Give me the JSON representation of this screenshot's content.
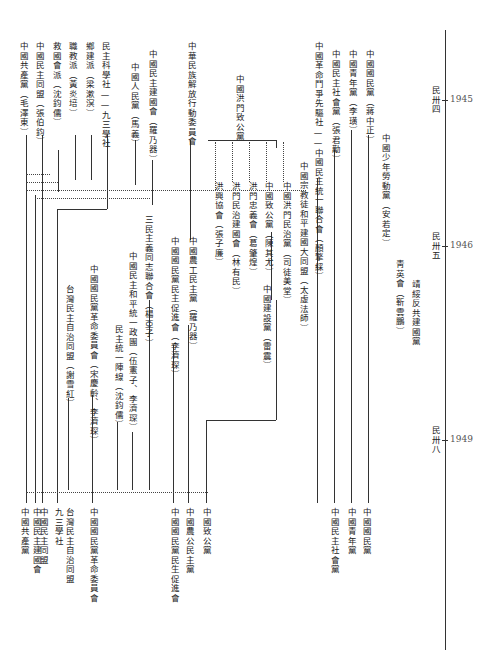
{
  "timeline": {
    "ticks": [
      {
        "era": "民卅四",
        "year": "1945",
        "y": 100
      },
      {
        "era": "民卅五",
        "year": "1946",
        "y": 246
      },
      {
        "era": "民卅八",
        "year": "1949",
        "y": 440
      }
    ]
  },
  "top_labels": [
    {
      "id": "l1",
      "text": "中國共產黨（毛澤東）",
      "x": 22,
      "y": 42
    },
    {
      "id": "l2",
      "text": "中國民主同盟（張伯鈞）",
      "x": 38,
      "y": 42
    },
    {
      "id": "l3",
      "text": "救國會派（沈鈞儒）",
      "x": 55,
      "y": 42
    },
    {
      "id": "l4",
      "text": "職教派（黃炎培）",
      "x": 71,
      "y": 42
    },
    {
      "id": "l5",
      "text": "鄉建派（梁漱溟）",
      "x": 88,
      "y": 42
    },
    {
      "id": "l6",
      "text": "民主科學社——九三學社",
      "x": 104,
      "y": 42
    },
    {
      "id": "l7",
      "text": "中國人民黨（馬義）",
      "x": 133,
      "y": 63
    },
    {
      "id": "l8",
      "text": "中國民主建國會（羅乃器）",
      "x": 151,
      "y": 50
    },
    {
      "id": "l9",
      "text": "中華民族解放行動委員會",
      "x": 190,
      "y": 42
    },
    {
      "id": "l10",
      "text": "中國洪門致公黨",
      "x": 238,
      "y": 75
    },
    {
      "id": "l11",
      "text": "中國革命鬥爭先驅社——中國民主統一聯合會（顏擎綵）",
      "x": 317,
      "y": 42
    },
    {
      "id": "l12",
      "text": "中國民主社會黨（張君勱）",
      "x": 334,
      "y": 50
    },
    {
      "id": "l13",
      "text": "中國青年黨（李璜）",
      "x": 351,
      "y": 50
    },
    {
      "id": "l14",
      "text": "中國國民黨（蔣中正）",
      "x": 368,
      "y": 50
    },
    {
      "id": "l15",
      "text": "中國少年勞動黨（安若定）",
      "x": 384,
      "y": 134
    },
    {
      "id": "l16",
      "text": "中國宗教徒和平建國大同盟（太虛法師）",
      "x": 302,
      "y": 162
    },
    {
      "id": "l17",
      "text": "中國洪門民治黨（司徒美堂）",
      "x": 285,
      "y": 182
    },
    {
      "id": "l18",
      "text": "中國致公黨（陳其尤）",
      "x": 267,
      "y": 182
    },
    {
      "id": "l19",
      "text": "洪門忠義會（葛肇煌）",
      "x": 251,
      "y": 182
    },
    {
      "id": "l20",
      "text": "洪門民治建國會（林有民）",
      "x": 234,
      "y": 182
    },
    {
      "id": "l21",
      "text": "洪興協會（張子廉）",
      "x": 217,
      "y": 182
    },
    {
      "id": "l22",
      "text": "靑英會（靳雲鵬）",
      "x": 398,
      "y": 260
    },
    {
      "id": "l23",
      "text": "靖綏反共建國黨",
      "x": 414,
      "y": 280
    },
    {
      "id": "l24",
      "text": "中國建設黨（雷震）",
      "x": 265,
      "y": 285
    },
    {
      "id": "l25",
      "text": "中國農工民主黨（羅乃器）",
      "x": 191,
      "y": 237
    },
    {
      "id": "l26",
      "text": "中國國民黨民主促進會（李濟琛）",
      "x": 173,
      "y": 237
    },
    {
      "id": "l27",
      "text": "三民主義同志聯合會（楊亞子）",
      "x": 147,
      "y": 215
    },
    {
      "id": "l28",
      "text": "中國民主和平統一政團（伍憲子、李濟琛）",
      "x": 131,
      "y": 252
    },
    {
      "id": "l29",
      "text": "民主統一陣線（沈鈞儒）",
      "x": 117,
      "y": 325
    },
    {
      "id": "l30",
      "text": "中國國民黨革命委員會（宋慶齡、李濟琛）",
      "x": 92,
      "y": 265
    },
    {
      "id": "l31",
      "text": "台灣民主自治同盟（謝雪紅）",
      "x": 68,
      "y": 285
    }
  ],
  "bottom_labels": [
    {
      "text": "中國共產黨",
      "x": 23
    },
    {
      "text": "中國民主建國會",
      "x": 35
    },
    {
      "text": "中國民主同盟",
      "x": 42
    },
    {
      "text": "九三學社",
      "x": 57
    },
    {
      "text": "台灣民主自治同盟",
      "x": 68
    },
    {
      "text": "中國國民黨革命委員會",
      "x": 92
    },
    {
      "text": "中國國民黨民生促進會",
      "x": 173
    },
    {
      "text": "中國農公民主黨",
      "x": 188
    },
    {
      "text": "中國致公黨",
      "x": 205
    },
    {
      "text": "中國民主社會黨",
      "x": 333
    },
    {
      "text": "中國青年黨",
      "x": 350
    },
    {
      "text": "中國國民黨",
      "x": 365
    }
  ]
}
